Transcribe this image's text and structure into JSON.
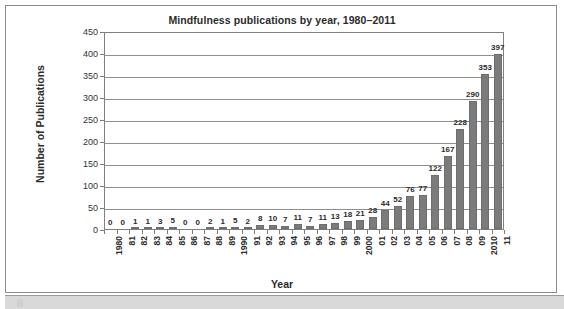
{
  "chart_data": {
    "type": "bar",
    "title": "Mindfulness publications by year, 1980–2011",
    "xlabel": "Year",
    "ylabel": "Number of Publications",
    "ylim": [
      0,
      450
    ],
    "ytick_step": 50,
    "yticks": [
      "450",
      "400",
      "350",
      "300",
      "250",
      "200",
      "150",
      "100",
      "50",
      "0"
    ],
    "grid": true,
    "legend": "none",
    "bar_color": "#7b7b7b",
    "categories": [
      "1980",
      "81",
      "82",
      "83",
      "84",
      "85",
      "86",
      "87",
      "88",
      "89",
      "1990",
      "91",
      "92",
      "93",
      "94",
      "95",
      "96",
      "97",
      "98",
      "99",
      "2000",
      "01",
      "02",
      "03",
      "04",
      "05",
      "06",
      "07",
      "08",
      "09",
      "2010",
      "11"
    ],
    "values": [
      0,
      0,
      1,
      1,
      3,
      5,
      0,
      0,
      2,
      1,
      5,
      2,
      8,
      10,
      7,
      11,
      7,
      11,
      13,
      18,
      21,
      28,
      44,
      52,
      76,
      77,
      122,
      167,
      228,
      290,
      353,
      397
    ],
    "data_labels": [
      "0",
      "0",
      "1",
      "1",
      "3",
      "5",
      "0",
      "0",
      "2",
      "1",
      "5",
      "2",
      "8",
      "10",
      "7",
      "11",
      "7",
      "11",
      "13",
      "18",
      "21",
      "28",
      "44",
      "52",
      "76",
      "77",
      "122",
      "167",
      "228",
      "290",
      "353",
      "397"
    ]
  },
  "figure": {
    "frame_border_color": "#8c8c8c",
    "background": "#ffffff"
  }
}
